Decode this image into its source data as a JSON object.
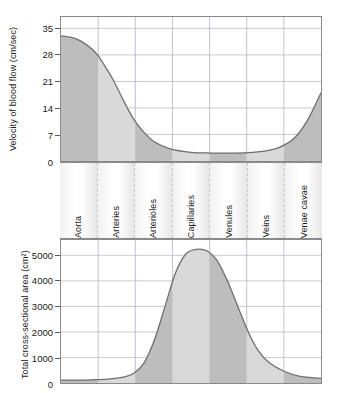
{
  "figure": {
    "vessel_segments": [
      "Aorta",
      "Arteries",
      "Arterioles",
      "Capillaries",
      "Venules",
      "Veins",
      "Venae cavae"
    ],
    "colors": {
      "curve_line": "#6e6e6e",
      "fill_light": "#d9d9d9",
      "fill_dark": "#bdbdbd",
      "frame": "#8a8a8a",
      "gridline": "#b9b9c9",
      "text": "#1a1a1a"
    }
  },
  "chart_data": [
    {
      "type": "area",
      "title": "",
      "ylabel": "Velocity of blood flow (cm/sec)",
      "xlabel": "",
      "ylim": [
        0,
        38
      ],
      "yticks": [
        0,
        7,
        14,
        21,
        28,
        35
      ],
      "ytick_labels": [
        "0",
        "7",
        "14",
        "21",
        "28",
        "35"
      ],
      "grid": true,
      "legend": "none",
      "categories": [
        "Aorta",
        "Arteries",
        "Arterioles",
        "Capillaries",
        "Venules",
        "Veins",
        "Venae cavae"
      ],
      "category_values": [
        33,
        15,
        2.5,
        2,
        2,
        4,
        16
      ],
      "x": [
        0,
        4,
        8,
        12,
        14,
        16,
        20,
        24,
        28,
        32,
        36,
        42,
        50,
        58,
        66,
        72,
        78,
        84,
        90,
        95,
        100
      ],
      "values": [
        33,
        32.6,
        31.5,
        29.5,
        28,
        26,
        21.5,
        16,
        11,
        7.5,
        5,
        3.2,
        2.3,
        2.1,
        2.1,
        2.2,
        2.6,
        3.6,
        6.2,
        11,
        18
      ]
    },
    {
      "type": "area",
      "title": "",
      "ylabel": "Total cross-sectional area (cm²)",
      "xlabel": "",
      "ylim": [
        0,
        5600
      ],
      "yticks": [
        0,
        1000,
        2000,
        3000,
        4000,
        5000
      ],
      "ytick_labels": [
        "0",
        "1000",
        "2000",
        "3000",
        "4000",
        "5000"
      ],
      "grid": true,
      "legend": "none",
      "categories": [
        "Aorta",
        "Arteries",
        "Arterioles",
        "Capillaries",
        "Venules",
        "Veins",
        "Venae cavae"
      ],
      "category_values": [
        100,
        150,
        1800,
        5200,
        2500,
        400,
        150
      ],
      "x": [
        0,
        6,
        12,
        18,
        24,
        28,
        32,
        36,
        40,
        44,
        48,
        52,
        56,
        60,
        64,
        68,
        72,
        76,
        80,
        86,
        92,
        100
      ],
      "values": [
        110,
        115,
        125,
        150,
        230,
        380,
        800,
        1700,
        3000,
        4300,
        5050,
        5230,
        5180,
        4800,
        4000,
        3000,
        2000,
        1250,
        800,
        450,
        260,
        180
      ]
    }
  ]
}
